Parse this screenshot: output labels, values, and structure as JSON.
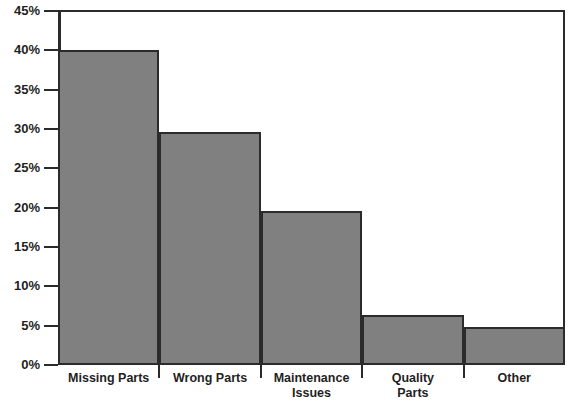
{
  "chart_data": {
    "type": "bar",
    "title": "",
    "subtitle": "",
    "xlabel": "",
    "ylabel": "",
    "categories": [
      "Missing Parts",
      "Wrong Parts",
      "Maintenance Issues",
      "Quality Parts",
      "Other"
    ],
    "values": [
      40.0,
      29.6,
      19.6,
      6.3,
      4.8
    ],
    "value_labels": [
      "40%",
      "29.6%",
      "19.6%",
      "6.3%",
      "4.8%"
    ],
    "ylim": [
      0,
      45
    ],
    "ytick_labels": [
      "0%",
      "5%",
      "10%",
      "15%",
      "20%",
      "25%",
      "30%",
      "35%",
      "40%",
      "45%"
    ],
    "ytick_values": [
      0,
      5,
      10,
      15,
      20,
      25,
      30,
      35,
      40,
      45
    ],
    "grid": false,
    "legend": null,
    "legend_position": "none",
    "bar_color": "#808080",
    "bar_edge_color": "#2b2b2b",
    "axis_color": "#2b2b2b",
    "background_color": "#ffffff",
    "annotations": []
  },
  "xtick_label_lines": [
    [
      "Missing Parts"
    ],
    [
      "Wrong Parts"
    ],
    [
      "Maintenance",
      "Issues"
    ],
    [
      "Quality",
      "Parts"
    ],
    [
      "Other"
    ]
  ]
}
